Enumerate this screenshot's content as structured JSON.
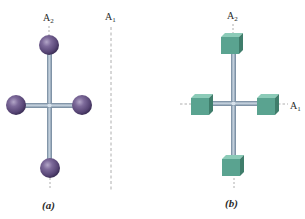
{
  "figure": {
    "panels": [
      {
        "id": "a",
        "caption": "(a)",
        "mass_shape": "sphere",
        "mass_color": "#6e5a8c",
        "mass_highlight": "#a596bd",
        "mass_shadow": "#3f3259",
        "rod_color": "#8fa6bb",
        "axes": [
          {
            "name": "A",
            "subscript": "2",
            "orientation": "vertical",
            "position": "through vertical rod"
          },
          {
            "name": "A",
            "subscript": "1",
            "orientation": "vertical",
            "position": "parallel, offset to the right"
          }
        ]
      },
      {
        "id": "b",
        "caption": "(b)",
        "mass_shape": "cube",
        "mass_color": "#5aa390",
        "mass_highlight": "#8ccbb8",
        "mass_shadow": "#3c7a69",
        "rod_color": "#8fa6bb",
        "axes": [
          {
            "name": "A",
            "subscript": "2",
            "orientation": "vertical",
            "position": "through vertical rod"
          },
          {
            "name": "A",
            "subscript": "1",
            "orientation": "horizontal",
            "position": "through horizontal rod"
          }
        ]
      }
    ]
  },
  "labels": {
    "a_axis2_main": "A",
    "a_axis2_sub": "2",
    "a_axis1_main": "A",
    "a_axis1_sub": "1",
    "a_caption": "(a)",
    "b_axis2_main": "A",
    "b_axis2_sub": "2",
    "b_axis1_main": "A",
    "b_axis1_sub": "1",
    "b_caption": "(b)"
  }
}
